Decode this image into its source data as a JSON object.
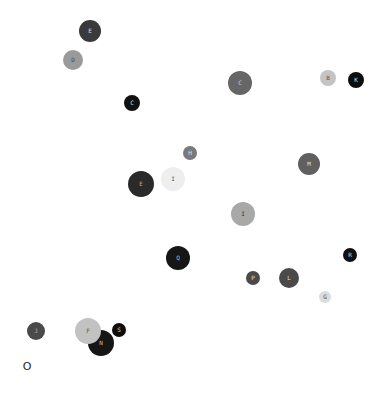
{
  "chart_data": {
    "type": "scatter",
    "title": "",
    "xlabel": "",
    "ylabel": "",
    "grid": false,
    "legend": null,
    "canvas": {
      "width": 383,
      "height": 394,
      "background": "#ffffff"
    },
    "points": [
      {
        "label": "E",
        "x": 90,
        "y": 31,
        "r": 11,
        "color": "#3a3a3a",
        "text_color": "#dddddd"
      },
      {
        "label": "D",
        "x": 73,
        "y": 60,
        "r": 10,
        "color": "#9a9a9a",
        "text_color": "#444444"
      },
      {
        "label": "C",
        "x": 132,
        "y": 103,
        "r": 8,
        "color": "#111111",
        "text_color": "#dddddd"
      },
      {
        "label": "C",
        "x": 240,
        "y": 83,
        "r": 12,
        "color": "#666666",
        "text_color": "#cccccc"
      },
      {
        "label": "B",
        "x": 328,
        "y": 78,
        "r": 8,
        "color": "#c4c4c4",
        "text_color": "#555555"
      },
      {
        "label": "K",
        "x": 356,
        "y": 80,
        "r": 8,
        "color": "#0e0e0e",
        "text_color": "#dddddd"
      },
      {
        "label": "H",
        "x": 190,
        "y": 153,
        "r": 7,
        "color": "#7a7a7a",
        "text_color": "#dddddd"
      },
      {
        "label": "E",
        "x": 141,
        "y": 184,
        "r": 13,
        "color": "#2a2a2a",
        "text_color": "#aaaaaa"
      },
      {
        "label": "I",
        "x": 173,
        "y": 179,
        "r": 12,
        "color": "#eeeeee",
        "text_color": "#555555"
      },
      {
        "label": "M",
        "x": 309,
        "y": 164,
        "r": 11,
        "color": "#606060",
        "text_color": "#dddddd"
      },
      {
        "label": "I",
        "x": 243,
        "y": 214,
        "r": 12,
        "color": "#a8a8a8",
        "text_color": "#333333"
      },
      {
        "label": "Q",
        "x": 178,
        "y": 258,
        "r": 12,
        "color": "#161616",
        "text_color": "#bbbbbb"
      },
      {
        "label": "R",
        "x": 350,
        "y": 255,
        "r": 7,
        "color": "#111111",
        "text_color": "#dddddd"
      },
      {
        "label": "P",
        "x": 253,
        "y": 278,
        "r": 7,
        "color": "#4a4a4a",
        "text_color": "#dddddd"
      },
      {
        "label": "L",
        "x": 289,
        "y": 278,
        "r": 10,
        "color": "#4a4a4a",
        "text_color": "#dddddd"
      },
      {
        "label": "G",
        "x": 325,
        "y": 297,
        "r": 6,
        "color": "#dcdcdc",
        "text_color": "#555555"
      },
      {
        "label": "J",
        "x": 36,
        "y": 331,
        "r": 9,
        "color": "#4a4a4a",
        "text_color": "#aaaaaa"
      },
      {
        "label": "N",
        "x": 101,
        "y": 343,
        "r": 13,
        "color": "#161616",
        "text_color": "#bbbbbb"
      },
      {
        "label": "F",
        "x": 88,
        "y": 331,
        "r": 13,
        "color": "#c2c2c2",
        "text_color": "#555555"
      },
      {
        "label": "S",
        "x": 119,
        "y": 330,
        "r": 7,
        "color": "#0e0e0e",
        "text_color": "#dddddd"
      }
    ],
    "annotations": [
      {
        "text": "O",
        "x": 27,
        "y": 366
      }
    ]
  }
}
